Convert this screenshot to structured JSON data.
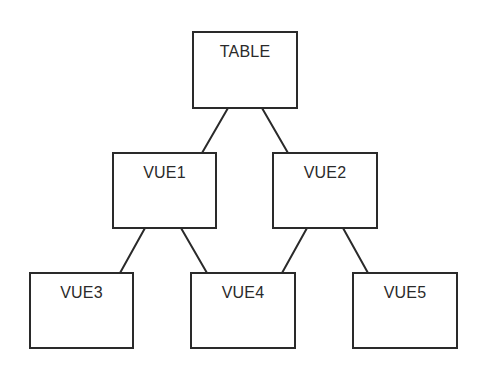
{
  "diagram": {
    "type": "tree",
    "stroke_color": "#2a2a2a",
    "background": "#ffffff",
    "nodes": [
      {
        "id": "table",
        "label": "TABLE",
        "x": 192,
        "y": 31,
        "w": 106,
        "h": 78
      },
      {
        "id": "vue1",
        "label": "VUE1",
        "x": 112,
        "y": 152,
        "w": 105,
        "h": 77
      },
      {
        "id": "vue2",
        "label": "VUE2",
        "x": 272,
        "y": 152,
        "w": 106,
        "h": 77
      },
      {
        "id": "vue3",
        "label": "VUE3",
        "x": 29,
        "y": 272,
        "w": 105,
        "h": 77
      },
      {
        "id": "vue4",
        "label": "VUE4",
        "x": 190,
        "y": 272,
        "w": 106,
        "h": 77
      },
      {
        "id": "vue5",
        "label": "VUE5",
        "x": 352,
        "y": 272,
        "w": 106,
        "h": 77
      }
    ],
    "edges": [
      {
        "from": "table",
        "to": "vue1",
        "x1": 228,
        "y1": 108,
        "x2": 202,
        "y2": 153
      },
      {
        "from": "table",
        "to": "vue2",
        "x1": 262,
        "y1": 108,
        "x2": 288,
        "y2": 153
      },
      {
        "from": "vue1",
        "to": "vue3",
        "x1": 145,
        "y1": 228,
        "x2": 120,
        "y2": 273
      },
      {
        "from": "vue1",
        "to": "vue4",
        "x1": 181,
        "y1": 228,
        "x2": 207,
        "y2": 273
      },
      {
        "from": "vue2",
        "to": "vue4",
        "x1": 307,
        "y1": 228,
        "x2": 282,
        "y2": 273
      },
      {
        "from": "vue2",
        "to": "vue5",
        "x1": 343,
        "y1": 228,
        "x2": 368,
        "y2": 273
      }
    ]
  }
}
